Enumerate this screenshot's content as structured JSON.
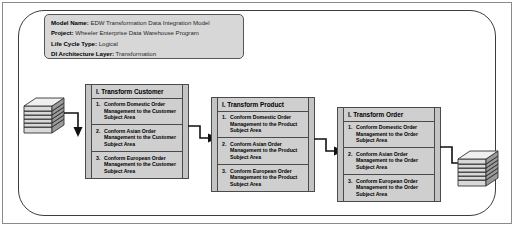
{
  "diagram": {
    "header": {
      "lines": [
        {
          "key": "Model Name:",
          "value": "EDW Transformation Data Integration Model"
        },
        {
          "key": "Project:",
          "value": "Wheeler Enterprise Data Warehouse Program"
        },
        {
          "key": "Life Cycle Type:",
          "value": "Logical"
        },
        {
          "key": "DI Architecture Layer:",
          "value": "Transformation"
        }
      ]
    },
    "processes": [
      {
        "title": "I. Transform Customer",
        "steps": [
          {
            "num": "1.",
            "text": "Conform Domestic Order Management to the Customer Subject Area"
          },
          {
            "num": "2.",
            "text": "Conform Asian Order Management to the Customer Subject Area"
          },
          {
            "num": "3.",
            "text": "Conform European Order Management to the Customer Subject Area"
          }
        ]
      },
      {
        "title": "I. Transform Product",
        "steps": [
          {
            "num": "1.",
            "text": "Conform Domestic Order Management to the Product Subject Area"
          },
          {
            "num": "2.",
            "text": "Conform Asian Order Management to the Product Subject Area"
          },
          {
            "num": "3.",
            "text": "Conform European Order Management to the Product Subject Area"
          }
        ]
      },
      {
        "title": "I. Transform Order",
        "steps": [
          {
            "num": "1.",
            "text": "Conform Domestic Order Management to the Order Subject Area"
          },
          {
            "num": "2.",
            "text": "Conform Asian Order Management to the Order Subject Area"
          },
          {
            "num": "3.",
            "text": "Conform European Order Management to the Order Subject Area"
          }
        ]
      }
    ],
    "data_stores": [
      {
        "name": "source-data-store"
      },
      {
        "name": "target-data-store"
      }
    ],
    "colors": {
      "box_fill": "#cfcfcf",
      "band_fill": "#c4c4c4",
      "header_fill": "#d7d7d7",
      "line": "#4a4a4a",
      "container_border": "#3d3d3d",
      "frame_border": "#8a8a8a"
    }
  }
}
